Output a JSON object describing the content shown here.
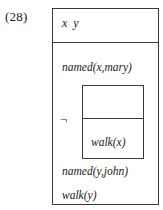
{
  "figure": {
    "label": "(28)",
    "kind": "discourse-representation-structure"
  },
  "drs": {
    "universe": {
      "referents_text": "x  y",
      "referents": [
        "x",
        "y"
      ]
    },
    "conditions": [
      {
        "id": "named-x-mary",
        "text": "named(x,mary)"
      },
      {
        "id": "named-y-john",
        "text": "named(y,john)"
      },
      {
        "id": "walk-y",
        "text": "walk(y)"
      }
    ],
    "negation": {
      "operator": "¬",
      "operator_name": "negation-symbol",
      "nested_drs": {
        "universe": {
          "referents_text": "",
          "referents": []
        },
        "conditions": [
          {
            "id": "walk-x",
            "text": "walk(x)"
          }
        ]
      }
    }
  },
  "colors": {
    "background": "#ffffff",
    "box_border": "#3a3a3a",
    "text": "#1a1a1a"
  }
}
